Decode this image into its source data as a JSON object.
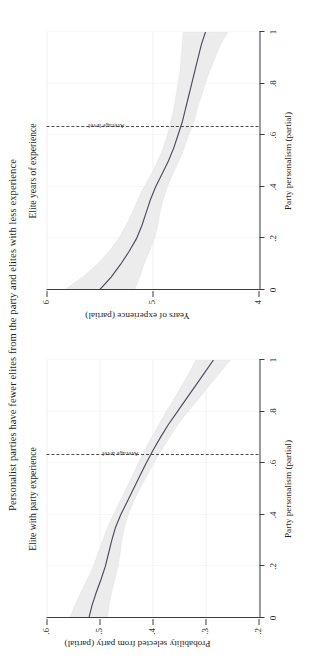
{
  "figure": {
    "suptitle": "Personalist parties have fewer elites from the party and elites with less experience",
    "background": "#ffffff",
    "line_color": "#4c4c5c",
    "band_color": "#ececec"
  },
  "chart_data": [
    {
      "type": "line",
      "panel_id": "left",
      "title": "Elite with party experience",
      "xlabel": "Party personalism (partial)",
      "ylabel": "Probability selected from party (partial)",
      "xlim": [
        0,
        1
      ],
      "ylim": [
        0.2,
        0.6
      ],
      "xticks": [
        0,
        0.2,
        0.4,
        0.6,
        0.8,
        1
      ],
      "xticklabels": [
        "0",
        ".2",
        ".4",
        ".6",
        ".8",
        "1"
      ],
      "yticks": [
        0.2,
        0.3,
        0.4,
        0.5,
        0.6
      ],
      "yticklabels": [
        ".2",
        ".3",
        ".4",
        ".5",
        ".6"
      ],
      "grid": true,
      "legend": "none",
      "annotations": [
        {
          "text": "Average level",
          "x": 0.63,
          "type": "vline-label"
        }
      ],
      "vline": {
        "x": 0.63,
        "style": "dashed",
        "label": "Average level"
      },
      "x": [
        0.0,
        0.05,
        0.1,
        0.15,
        0.2,
        0.25,
        0.3,
        0.35,
        0.4,
        0.45,
        0.5,
        0.55,
        0.6,
        0.65,
        0.7,
        0.75,
        0.8,
        0.85,
        0.9,
        0.95,
        1.0
      ],
      "series": [
        {
          "name": "fit",
          "values": [
            0.52,
            0.514,
            0.506,
            0.497,
            0.489,
            0.483,
            0.477,
            0.47,
            0.46,
            0.448,
            0.436,
            0.424,
            0.412,
            0.399,
            0.385,
            0.37,
            0.353,
            0.336,
            0.319,
            0.302,
            0.285
          ]
        },
        {
          "name": "ci_upper",
          "values": [
            0.556,
            0.546,
            0.535,
            0.523,
            0.512,
            0.503,
            0.494,
            0.485,
            0.474,
            0.462,
            0.45,
            0.438,
            0.427,
            0.415,
            0.402,
            0.388,
            0.374,
            0.359,
            0.345,
            0.331,
            0.318
          ]
        },
        {
          "name": "ci_lower",
          "values": [
            0.485,
            0.482,
            0.477,
            0.471,
            0.465,
            0.461,
            0.458,
            0.453,
            0.446,
            0.436,
            0.424,
            0.411,
            0.398,
            0.383,
            0.368,
            0.352,
            0.333,
            0.313,
            0.293,
            0.273,
            0.253
          ]
        }
      ]
    },
    {
      "type": "line",
      "panel_id": "right",
      "title": "Elite years of experience",
      "xlabel": "Party personalism (partial)",
      "ylabel": "Years of experience (partial)",
      "xlim": [
        0,
        1
      ],
      "ylim": [
        4,
        6
      ],
      "xticks": [
        0,
        0.2,
        0.4,
        0.6,
        0.8,
        1
      ],
      "xticklabels": [
        "0",
        ".2",
        ".4",
        ".6",
        ".8",
        "1"
      ],
      "yticks": [
        4,
        5,
        6
      ],
      "yticklabels": [
        "4",
        "5",
        "6"
      ],
      "grid": true,
      "legend": "none",
      "annotations": [
        {
          "text": "Average level",
          "x": 0.63,
          "type": "vline-label"
        }
      ],
      "vline": {
        "x": 0.63,
        "style": "dashed",
        "label": "Average level"
      },
      "x": [
        0.0,
        0.05,
        0.1,
        0.15,
        0.2,
        0.25,
        0.3,
        0.35,
        0.4,
        0.45,
        0.5,
        0.55,
        0.6,
        0.65,
        0.7,
        0.75,
        0.8,
        0.85,
        0.9,
        0.95,
        1.0
      ],
      "series": [
        {
          "name": "fit",
          "values": [
            5.5,
            5.39,
            5.3,
            5.22,
            5.15,
            5.1,
            5.06,
            5.02,
            4.97,
            4.91,
            4.85,
            4.8,
            4.76,
            4.72,
            4.69,
            4.66,
            4.63,
            4.6,
            4.57,
            4.54,
            4.5
          ]
        },
        {
          "name": "ci_upper",
          "values": [
            5.83,
            5.66,
            5.52,
            5.41,
            5.32,
            5.25,
            5.19,
            5.14,
            5.08,
            5.01,
            4.95,
            4.9,
            4.86,
            4.83,
            4.8,
            4.78,
            4.76,
            4.74,
            4.73,
            4.72,
            4.71
          ]
        },
        {
          "name": "ci_lower",
          "values": [
            5.17,
            5.12,
            5.08,
            5.03,
            4.98,
            4.95,
            4.93,
            4.9,
            4.86,
            4.81,
            4.75,
            4.7,
            4.66,
            4.61,
            4.58,
            4.54,
            4.5,
            4.46,
            4.41,
            4.36,
            4.29
          ]
        }
      ]
    }
  ]
}
